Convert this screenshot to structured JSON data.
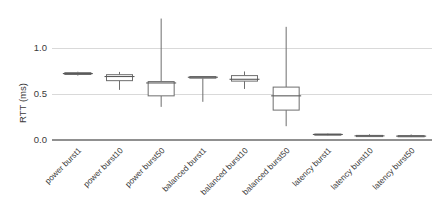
{
  "chart_data": {
    "type": "boxplot",
    "title": "",
    "subtitle": "",
    "xlabel": "",
    "ylabel": "RTT (ms)",
    "ylim": [
      0.0,
      1.4
    ],
    "yticks": [
      0.0,
      0.5,
      1.0
    ],
    "ytick_labels": [
      "0.0",
      "0.5",
      "1.0"
    ],
    "grid": "horizontal",
    "legend": "none",
    "categories": [
      "power burst1",
      "power burst10",
      "power burst50",
      "balanced burst1",
      "balanced burst10",
      "balanced burst50",
      "latency burst1",
      "latency burst10",
      "latency burst50"
    ],
    "boxes": [
      {
        "label": "power burst1",
        "whisker_low": 0.7,
        "q1": 0.712,
        "median": 0.722,
        "q3": 0.732,
        "whisker_high": 0.742
      },
      {
        "label": "power burst10",
        "whisker_low": 0.545,
        "q1": 0.645,
        "median": 0.69,
        "q3": 0.71,
        "whisker_high": 0.74
      },
      {
        "label": "power burst50",
        "whisker_low": 0.36,
        "q1": 0.48,
        "median": 0.62,
        "q3": 0.635,
        "whisker_high": 1.32
      },
      {
        "label": "balanced burst1",
        "whisker_low": 0.415,
        "q1": 0.672,
        "median": 0.682,
        "q3": 0.69,
        "whisker_high": 0.695
      },
      {
        "label": "balanced burst10",
        "whisker_low": 0.555,
        "q1": 0.64,
        "median": 0.66,
        "q3": 0.7,
        "whisker_high": 0.745
      },
      {
        "label": "balanced burst50",
        "whisker_low": 0.15,
        "q1": 0.325,
        "median": 0.48,
        "q3": 0.575,
        "whisker_high": 1.23
      },
      {
        "label": "latency burst1",
        "whisker_low": 0.05,
        "q1": 0.055,
        "median": 0.06,
        "q3": 0.065,
        "whisker_high": 0.07
      },
      {
        "label": "latency burst10",
        "whisker_low": 0.035,
        "q1": 0.04,
        "median": 0.045,
        "q3": 0.05,
        "whisker_high": 0.062
      },
      {
        "label": "latency burst50",
        "whisker_low": 0.032,
        "q1": 0.038,
        "median": 0.042,
        "q3": 0.048,
        "whisker_high": 0.06
      }
    ],
    "colors": {
      "box_stroke": "#6e6e6e",
      "box_fill": "#ffffff",
      "gridline": "#d9d9d9",
      "axis": "#909090",
      "text": "#3a3a3a",
      "background": "#ffffff"
    }
  },
  "layout": {
    "plot_left": 57,
    "plot_right": 432,
    "y_pixel_zero": 140,
    "y_pixel_one": 48,
    "box_width": 26,
    "cap_width": 30,
    "label_rotation": -45
  }
}
